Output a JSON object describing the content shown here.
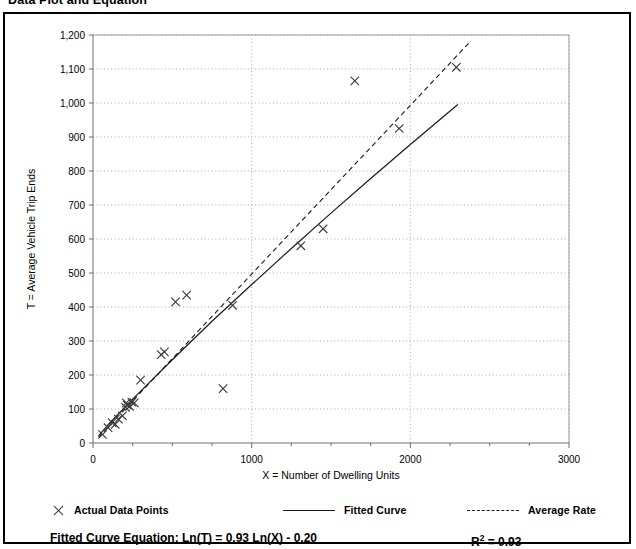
{
  "page": {
    "title": "Data Plot and Equation"
  },
  "legend": {
    "actual_points": "Actual Data Points",
    "fitted_curve": "Fitted Curve",
    "average_rate": "Average Rate"
  },
  "equation": {
    "label": "Fitted Curve Equation:",
    "formula": "Ln(T) = 0.93 Ln(X) - 0.20",
    "full": "Fitted Curve Equation:  Ln(T) = 0.93 Ln(X) - 0.20",
    "r_squared_symbol": "R",
    "r_squared_exponent": "2",
    "r_squared_value": "= 0.93"
  },
  "colors": {
    "frame": "#000000",
    "axis": "#808080",
    "gridline": "#a8a8a8",
    "marker": "#3a3a3a",
    "fitted_curve": "#1a1a1a",
    "average_rate": "#1a1a1a",
    "background": "#ffffff"
  },
  "chart_data": {
    "type": "scatter",
    "title": "Data Plot and Equation",
    "xlabel": "X = Number of Dwelling Units",
    "ylabel": "T = Average Vehicle Trip Ends",
    "xlim": [
      0,
      3000
    ],
    "ylim": [
      0,
      1200
    ],
    "xticks": [
      0,
      1000,
      2000,
      3000
    ],
    "xtick_labels": [
      "0",
      "1000",
      "2000",
      "3000"
    ],
    "xminor_tick_interval": 250,
    "yticks": [
      0,
      100,
      200,
      300,
      400,
      500,
      600,
      700,
      800,
      900,
      1000,
      1100,
      1200
    ],
    "ytick_labels": [
      "0",
      "100",
      "200",
      "300",
      "400",
      "500",
      "600",
      "700",
      "800",
      "900",
      "1,000",
      "1,100",
      "1,200"
    ],
    "grid": {
      "horizontal": true,
      "vertical": true,
      "style": "dotted"
    },
    "legend_position": "below-plot",
    "series": [
      {
        "name": "Actual Data Points",
        "type": "scatter",
        "marker": "x",
        "points": [
          [
            60,
            25
          ],
          [
            95,
            45
          ],
          [
            120,
            60
          ],
          [
            140,
            55
          ],
          [
            160,
            70
          ],
          [
            185,
            80
          ],
          [
            205,
            105
          ],
          [
            210,
            118
          ],
          [
            215,
            112
          ],
          [
            230,
            108
          ],
          [
            245,
            120
          ],
          [
            260,
            118
          ],
          [
            300,
            185
          ],
          [
            430,
            260
          ],
          [
            450,
            268
          ],
          [
            520,
            415
          ],
          [
            590,
            435
          ],
          [
            820,
            160
          ],
          [
            880,
            405
          ],
          [
            1310,
            580
          ],
          [
            1450,
            630
          ],
          [
            1650,
            1065
          ],
          [
            1930,
            925
          ],
          [
            2290,
            1105
          ]
        ]
      },
      {
        "name": "Fitted Curve",
        "type": "line",
        "style": "solid",
        "equation": "Ln(T) = 0.93 Ln(X) - 0.20",
        "r_squared": 0.93,
        "points": [
          [
            35,
            21
          ],
          [
            100,
            56
          ],
          [
            250,
            129
          ],
          [
            500,
            245
          ],
          [
            750,
            358
          ],
          [
            1000,
            466
          ],
          [
            1250,
            572
          ],
          [
            1500,
            676
          ],
          [
            1750,
            778
          ],
          [
            2000,
            878
          ],
          [
            2290,
            992
          ],
          [
            2300,
            996
          ]
        ]
      },
      {
        "name": "Average Rate",
        "type": "line",
        "style": "dashed",
        "points": [
          [
            35,
            17
          ],
          [
            500,
            248
          ],
          [
            1000,
            497
          ],
          [
            1500,
            745
          ],
          [
            2000,
            993
          ],
          [
            2380,
            1182
          ]
        ]
      }
    ]
  }
}
